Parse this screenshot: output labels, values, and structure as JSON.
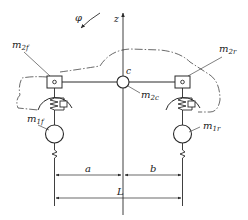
{
  "diagram": {
    "colors": {
      "stroke": "#2a2a2a",
      "background": "#ffffff"
    },
    "labels": {
      "rotation": "φ",
      "axis": "z",
      "center": "c",
      "sprung_left": {
        "base": "m",
        "sub": "2f"
      },
      "sprung_right": {
        "base": "m",
        "sub": "2r"
      },
      "sprung_center": {
        "base": "m",
        "sub": "2c"
      },
      "unsprung_left": {
        "base": "m",
        "sub": "1f"
      },
      "unsprung_right": {
        "base": "m",
        "sub": "1r"
      },
      "dim_a": "a",
      "dim_b": "b",
      "dim_L": "L"
    },
    "components": [
      "car-body-outline",
      "z-axis",
      "pitch-rotation-arrow",
      "body-beam",
      "center-mass",
      "front-sprung-mass",
      "rear-sprung-mass",
      "front-suspension-spring-damper",
      "rear-suspension-spring-damper",
      "front-unsprung-mass",
      "rear-unsprung-mass",
      "front-tire-spring",
      "rear-tire-spring",
      "dimension-a",
      "dimension-b",
      "dimension-L"
    ]
  }
}
